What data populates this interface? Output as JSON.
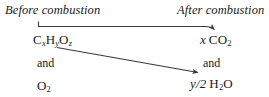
{
  "diagram": {
    "headings": {
      "before": "Before combustion",
      "after": "After combustion"
    },
    "left_column": {
      "fuel": {
        "element1": "C",
        "sub1": "x",
        "element2": "H",
        "sub2": "y",
        "element3": "O",
        "sub3": "z"
      },
      "conjunction": "and",
      "oxygen": {
        "element": "O",
        "sub": "2"
      }
    },
    "right_column": {
      "carbon_dioxide": {
        "coefficient": "x",
        "element1": "C",
        "element2": "O",
        "sub": "2"
      },
      "conjunction": "and",
      "water": {
        "coefficient": "y/2",
        "element1": "H",
        "sub": "2",
        "element2": "O"
      }
    },
    "arrows": [
      {
        "name": "carbon-path-arrow",
        "from": "CxHyOz",
        "to": "x CO2"
      },
      {
        "name": "hydrogen-path-arrow",
        "from": "CxHyOz",
        "to": "y/2 H2O"
      }
    ],
    "colors": {
      "ink": "#1a1a1a",
      "background": "#ffffff",
      "arrow": "#3a3a3a"
    }
  }
}
